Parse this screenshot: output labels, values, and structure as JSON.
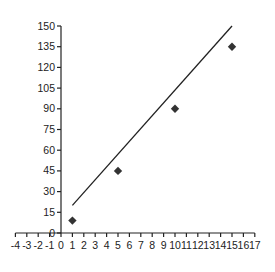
{
  "chart_data": {
    "type": "scatter",
    "title": "",
    "xlabel": "",
    "ylabel": "",
    "xlim": [
      -4,
      17
    ],
    "ylim": [
      0,
      150
    ],
    "x_ticks": [
      -4,
      -3,
      -2,
      -1,
      0,
      1,
      2,
      3,
      4,
      5,
      6,
      7,
      8,
      9,
      10,
      11,
      12,
      13,
      14,
      15,
      16,
      17
    ],
    "y_ticks": [
      0,
      15,
      30,
      45,
      60,
      75,
      90,
      105,
      120,
      135,
      150
    ],
    "grid": false,
    "legend": null,
    "series": [
      {
        "name": "data points",
        "kind": "scatter",
        "marker": "diamond",
        "color": "#333333",
        "points": [
          {
            "x": 1,
            "y": 9
          },
          {
            "x": 5,
            "y": 45
          },
          {
            "x": 10,
            "y": 90
          },
          {
            "x": 15,
            "y": 135
          }
        ]
      },
      {
        "name": "line",
        "kind": "line",
        "color": "#222222",
        "points": [
          {
            "x": 1,
            "y": 20
          },
          {
            "x": 15,
            "y": 150
          }
        ]
      }
    ]
  }
}
